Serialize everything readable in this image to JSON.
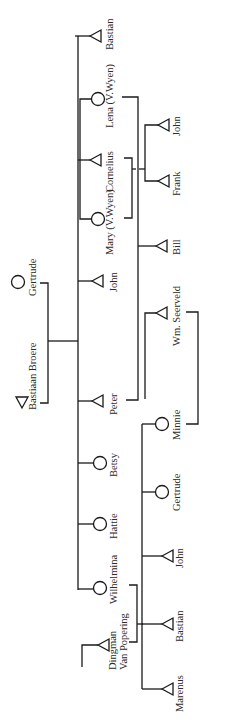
{
  "diagram": {
    "type": "genealogy-tree",
    "orientation": "rotated-90",
    "legend": {
      "triangle": "male",
      "circle": "female"
    },
    "parents": [
      {
        "id": "bastiaan_broere",
        "name": "Bastiaan Broere",
        "sex": "male"
      },
      {
        "id": "gertrude_sr",
        "name": "Gertrude",
        "sex": "female"
      }
    ],
    "children": [
      {
        "id": "bastian",
        "name": "Bastian",
        "sex": "male"
      },
      {
        "id": "lena",
        "name": "Lena (V.Wyen)",
        "sex": "female"
      },
      {
        "id": "cornelius",
        "name": "Cornelius",
        "sex": "male"
      },
      {
        "id": "mary",
        "name": "Mary (V.Wyen)",
        "sex": "female"
      },
      {
        "id": "john",
        "name": "John",
        "sex": "male"
      },
      {
        "id": "peter",
        "name": "Peter",
        "sex": "male"
      },
      {
        "id": "betsy",
        "name": "Betsy",
        "sex": "female"
      },
      {
        "id": "hattie",
        "name": "Hattie",
        "sex": "female"
      },
      {
        "id": "wilhelmina",
        "name": "Wilhelmina",
        "sex": "female"
      }
    ],
    "spouses": [
      {
        "id": "wm_seerveld",
        "name": "Wm. Seerveld",
        "sex": "male"
      },
      {
        "id": "dingman",
        "name": "Dingman Van Popering",
        "line1": "Dingman",
        "line2": "Van Popering",
        "sex": "male"
      }
    ],
    "grandchildren": [
      {
        "id": "gc_john",
        "name": "John",
        "sex": "male",
        "parents": "Lena & Cornelius"
      },
      {
        "id": "gc_frank",
        "name": "Frank",
        "sex": "male",
        "parents": "Mary & Cornelius"
      },
      {
        "id": "gc_bill",
        "name": "Bill",
        "sex": "male",
        "parents": "Peter"
      },
      {
        "id": "gc_minnie",
        "name": "Minnie",
        "sex": "female",
        "parents": "Wilhelmina & Dingman Van Popering"
      },
      {
        "id": "gc_gertrude",
        "name": "Gertrude",
        "sex": "female",
        "parents": "Wilhelmina & Dingman Van Popering"
      },
      {
        "id": "gc_john2",
        "name": "John",
        "sex": "male",
        "parents": "Wilhelmina & Dingman Van Popering"
      },
      {
        "id": "gc_bastian",
        "name": "Bastian",
        "sex": "male",
        "parents": "Wilhelmina & Dingman Van Popering"
      },
      {
        "id": "gc_marenus",
        "name": "Marenus",
        "sex": "male",
        "parents": "Wilhelmina & Dingman Van Popering"
      }
    ],
    "marriages": [
      {
        "a": "Minnie",
        "b": "Wm. Seerveld"
      }
    ]
  }
}
